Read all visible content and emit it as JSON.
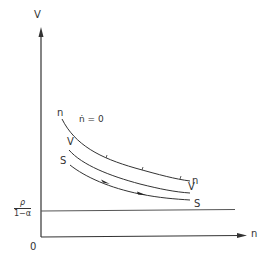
{
  "diagram": {
    "axes": {
      "y_label": "V",
      "x_label": "n",
      "origin_label": "0"
    },
    "threshold": {
      "numerator": "ρ",
      "denominator": "1−α"
    },
    "curves": [
      {
        "name": "n",
        "start_label": "n",
        "end_label": "n",
        "annotation": "ṅ = 0"
      },
      {
        "name": "V",
        "start_label": "V",
        "end_label": "V"
      },
      {
        "name": "S",
        "start_label": "S",
        "end_label": "S",
        "direction_arrows": 2
      }
    ],
    "colors": {
      "line": "#333333",
      "background": "#ffffff"
    }
  }
}
